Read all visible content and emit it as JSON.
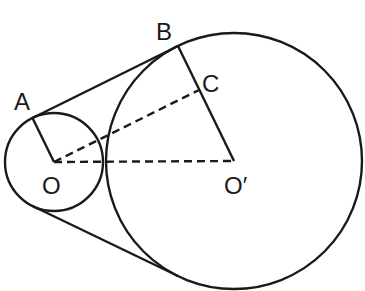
{
  "diagram": {
    "type": "two-circle external tangent",
    "labels": {
      "A": "A",
      "B": "B",
      "C": "C",
      "O": "O",
      "O_prime": "O′"
    },
    "points": {
      "O": [
        54,
        162
      ],
      "O_prime": [
        234,
        161
      ],
      "A": [
        32.5,
        118
      ],
      "B": [
        178,
        46
      ],
      "C": [
        199,
        90
      ]
    },
    "circles": [
      {
        "name": "small",
        "center": "O",
        "r": 49
      },
      {
        "name": "large",
        "center": "O_prime",
        "r": 128
      }
    ],
    "stroke_color": "#1a1a1a"
  }
}
